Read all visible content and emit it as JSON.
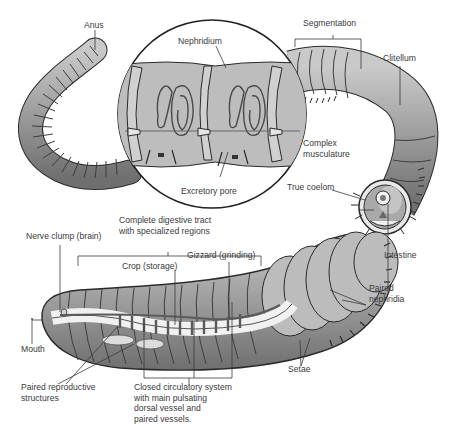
{
  "diagram": {
    "colors": {
      "body_dark": "#7d7d7d",
      "body_mid": "#a8a8a8",
      "body_light": "#d6d6d6",
      "outline": "#2b2b2b",
      "label_text": "#3a3a3a",
      "leader_line": "#3a3a3a",
      "vessel": "#5a5a5a"
    },
    "labels": {
      "anus": "Anus",
      "nephridium": "Nephridium",
      "segmentation": "Segmentation",
      "clitellum": "Clitellum",
      "complex_musculature": [
        "Complex",
        "musculature"
      ],
      "true_coelom": "True coelom",
      "excretory_pore": "Excretory pore",
      "intestine": "Intestine",
      "nerve_clump": "Nerve clump (brain)",
      "digestive_tract": [
        "Complete digestive tract",
        "with specialized regions"
      ],
      "crop": "Crop (storage)",
      "gizzard": "Gizzard (grinding)",
      "paired_nephridia": [
        "Paired",
        "nephridia"
      ],
      "mouth": "Mouth",
      "setae": "Setae",
      "reproductive": [
        "Paired reproductive",
        "structures"
      ],
      "circulatory": [
        "Closed circulatory system",
        "with main pulsating",
        "dorsal vessel and",
        "paired vessels."
      ]
    }
  }
}
